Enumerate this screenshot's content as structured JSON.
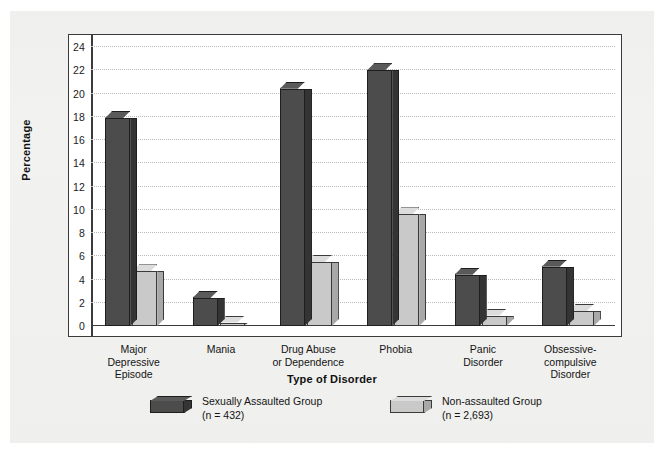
{
  "chart_data": {
    "type": "bar",
    "title": "",
    "xlabel": "Type of Disorder",
    "ylabel": "Percentage",
    "ylim": [
      0,
      24
    ],
    "ytick_step": 2,
    "yticks": [
      24,
      22,
      20,
      18,
      16,
      14,
      12,
      10,
      8,
      6,
      4,
      2,
      0
    ],
    "grid": true,
    "grid_style": "dotted-horizontal",
    "legend_position": "bottom",
    "style": "3d-bar",
    "categories": [
      "Major\nDepressive\nEpisode",
      "Mania",
      "Drug Abuse\nor Dependence",
      "Phobia",
      "Panic\nDisorder",
      "Obsessive-\ncompulsive\nDisorder"
    ],
    "series": [
      {
        "name": "Sexually Assaulted Group",
        "sub": "(n = 432)",
        "color": "#4c4c4c",
        "values": [
          17.9,
          2.4,
          20.4,
          22.0,
          4.4,
          5.1
        ]
      },
      {
        "name": "Non-assaulted Group",
        "sub": "(n = 2,693)",
        "color": "#c9c9c9",
        "values": [
          4.7,
          0.3,
          5.5,
          9.6,
          0.9,
          1.3
        ]
      }
    ]
  },
  "axis": {
    "y_title": "Percentage",
    "x_title": "Type of Disorder"
  },
  "colors": {
    "dark_series": "#4c4c4c",
    "light_series": "#c9c9c9",
    "frame": "#3b3b3b",
    "grid": "#b9b9b9",
    "page_background": "#f2f2f0",
    "plot_background": "#ffffff"
  }
}
